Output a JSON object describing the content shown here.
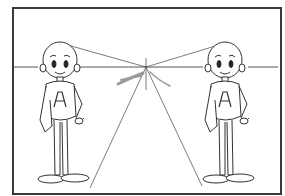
{
  "diagram": {
    "type": "one-point perspective illustration",
    "frame": {
      "border_color": "#3a3a3a",
      "background": "#ffffff"
    },
    "horizon_line": {
      "y": 67,
      "color": "#555555"
    },
    "vanishing_point": {
      "x": 146,
      "y": 67
    },
    "characters": [
      {
        "id": "left",
        "chest_letter": "A",
        "position": "left"
      },
      {
        "id": "right",
        "chest_letter": "A",
        "position": "right"
      }
    ],
    "annotation_mark": {
      "color": "#8a8a8a",
      "description": "smudged pencil stroke near vanishing point"
    }
  }
}
